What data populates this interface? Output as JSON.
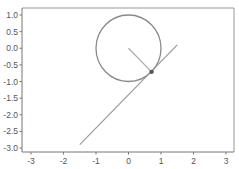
{
  "chart_data": {
    "type": "line",
    "title": "",
    "xlabel": "",
    "ylabel": "",
    "xlim": [
      -3.3,
      3.25
    ],
    "ylim": [
      -3.1,
      1.2
    ],
    "grid": false,
    "x_ticks": [
      -3,
      -2,
      -1,
      0,
      1,
      2,
      3
    ],
    "x_tick_labels": [
      "-3",
      "-2",
      "-1",
      "0",
      "1",
      "2",
      "3"
    ],
    "y_ticks": [
      1.0,
      0.5,
      0.0,
      -0.5,
      -1.0,
      -1.5,
      -2.0,
      -2.5,
      -3.0
    ],
    "y_tick_labels": [
      "1.0",
      "0.5",
      "0.0",
      "-0.5",
      "-1.0",
      "-1.5",
      "-2.0",
      "-2.5",
      "-3.0"
    ],
    "series": [
      {
        "name": "unit-circle",
        "kind": "circle",
        "center": [
          0,
          0
        ],
        "radius": 1,
        "color": "#8a8a8a"
      },
      {
        "name": "radius-line",
        "x": [
          0,
          0.71
        ],
        "y": [
          0,
          -0.71
        ],
        "color": "#aaaaaa"
      },
      {
        "name": "tangent-line",
        "x": [
          -1.5,
          1.5
        ],
        "y": [
          -2.9,
          0.1
        ],
        "color": "#999999"
      },
      {
        "name": "tangent-point",
        "kind": "point",
        "x": [
          0.71
        ],
        "y": [
          -0.71
        ],
        "color": "#555555"
      }
    ]
  },
  "colors": {
    "axis": "#777777",
    "frame": "#999999",
    "circle": "#8a8a8a",
    "radius": "#aaaaaa",
    "tangent": "#999999",
    "point": "#555555"
  }
}
